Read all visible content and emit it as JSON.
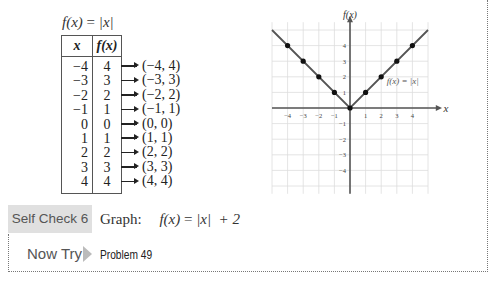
{
  "function_label": {
    "lhs": "f(x)",
    "eq": "=",
    "rhs": "|x|"
  },
  "table": {
    "headers": [
      "x",
      "f(x)"
    ],
    "rows": [
      {
        "x": "−4",
        "fx": "4",
        "point": "(−4, 4)"
      },
      {
        "x": "−3",
        "fx": "3",
        "point": "(−3, 3)"
      },
      {
        "x": "−2",
        "fx": "2",
        "point": "(−2, 2)"
      },
      {
        "x": "−1",
        "fx": "1",
        "point": "(−1, 1)"
      },
      {
        "x": "0",
        "fx": "0",
        "point": "(0, 0)"
      },
      {
        "x": "1",
        "fx": "1",
        "point": "(1, 1)"
      },
      {
        "x": "2",
        "fx": "2",
        "point": "(2, 2)"
      },
      {
        "x": "3",
        "fx": "3",
        "point": "(3, 3)"
      },
      {
        "x": "4",
        "fx": "4",
        "point": "(4, 4)"
      }
    ]
  },
  "graph": {
    "y_axis_label": "f(x)",
    "x_axis_label": "x",
    "curve_label": "f(x) = |x|",
    "x_ticks": [
      "−4",
      "−3",
      "−2",
      "−1",
      "1",
      "2",
      "3",
      "4"
    ],
    "y_ticks": [
      "4",
      "3",
      "2",
      "1",
      "−1",
      "−2",
      "−3",
      "−4"
    ],
    "points": [
      [
        -4,
        4
      ],
      [
        -3,
        3
      ],
      [
        -2,
        2
      ],
      [
        -1,
        1
      ],
      [
        0,
        0
      ],
      [
        1,
        1
      ],
      [
        2,
        2
      ],
      [
        3,
        3
      ],
      [
        4,
        4
      ]
    ],
    "colors": {
      "curve": "#555555",
      "grid": "#dddddd",
      "axis": "#555555"
    }
  },
  "self_check": {
    "badge": "Self Check 6",
    "prompt": "Graph:",
    "expr_lhs": "f(x)",
    "expr_eq": "=",
    "expr_rhs": "|x|  + 2"
  },
  "now_try": {
    "label": "Now Try",
    "link": "Problem 49"
  }
}
